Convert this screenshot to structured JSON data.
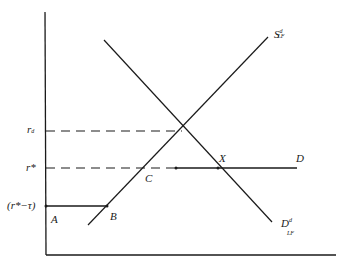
{
  "diagram": {
    "type": "supply-demand",
    "colors": {
      "line": "#1a1a1a",
      "background": "#ffffff"
    },
    "y_axis_labels": {
      "r_d": "r",
      "r_d_sub": "d",
      "r_star": "r*",
      "r_star_minus_tau": "(r*−τ)"
    },
    "points": {
      "A": "A",
      "B": "B",
      "C": "C",
      "X": "X",
      "D": "D"
    },
    "curves": {
      "supply": {
        "main": "S",
        "sup": "d",
        "sub": "LF"
      },
      "demand": {
        "main": "D",
        "sup": "d",
        "sub": "LF"
      }
    }
  }
}
